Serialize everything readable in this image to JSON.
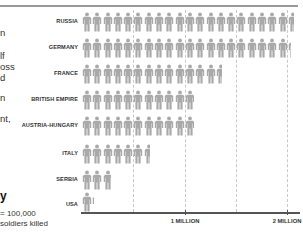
{
  "chart_data": {
    "type": "pictograph-bar",
    "title": "",
    "xlabel": "",
    "ylabel": "",
    "unit": "1 figure = 100,000 soldiers killed",
    "categories": [
      "RUSSIA",
      "GERMANY",
      "FRANCE",
      "BRITISH EMPIRE",
      "AUSTRIA-HUNGARY",
      "ITALY",
      "SERBIA",
      "USA"
    ],
    "values": [
      2060000,
      2030000,
      1360000,
      1090000,
      1090000,
      660000,
      280000,
      120000
    ],
    "xlim": [
      0,
      2100000
    ],
    "x_ticks": [
      {
        "value": 1000000,
        "label": "1 MILLION"
      },
      {
        "value": 2000000,
        "label": "2 MILLION"
      }
    ],
    "gridlines": [
      500000,
      1000000,
      1500000,
      2000000
    ],
    "grid": true
  },
  "colors": {
    "figure": "#a9a9a9",
    "axis": "#555555",
    "grid": "#c8c8c8",
    "rule": "#9a9a9a"
  },
  "left_text": {
    "fragments": [
      "n",
      "lf",
      "oss",
      "d",
      "n",
      "nt,"
    ]
  },
  "key": {
    "title": "y",
    "line1": "= 100,000",
    "line2": "soldiers killed"
  },
  "labels": {
    "russia": "RUSSIA",
    "germany": "GERMANY",
    "france": "FRANCE",
    "british_empire": "BRITISH EMPIRE",
    "austria_hungary": "AUSTRIA-HUNGARY",
    "italy": "ITALY",
    "serbia": "SERBIA",
    "usa": "USA",
    "tick_1m": "1 MILLION",
    "tick_2m": "2 MILLION"
  }
}
